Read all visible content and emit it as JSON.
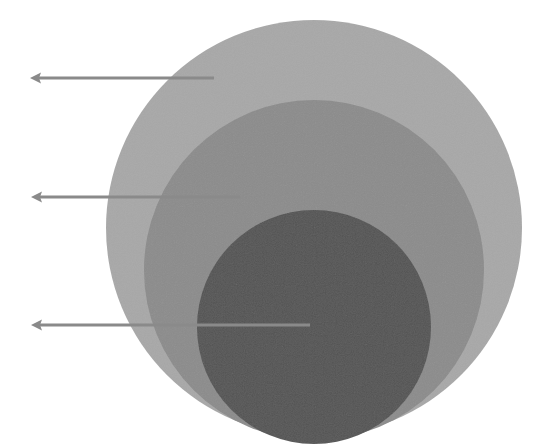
{
  "diagram": {
    "type": "nested-circles",
    "labels": [],
    "circles": [
      {
        "name": "outer",
        "cx": 314,
        "cy": 228,
        "r": 208,
        "color": "#a8a8a8"
      },
      {
        "name": "middle",
        "cx": 314,
        "cy": 270,
        "r": 170,
        "color": "#8c8c8c"
      },
      {
        "name": "inner",
        "cx": 314,
        "cy": 327,
        "r": 117,
        "color": "#545454"
      }
    ],
    "arrows": [
      {
        "name": "outer-arrow",
        "y": 78,
        "x_tail": 214,
        "x_tip": 30,
        "color": "#8a8a8a"
      },
      {
        "name": "middle-arrow",
        "y": 197,
        "x_tail": 240,
        "x_tip": 31,
        "color": "#8a8a8a"
      },
      {
        "name": "inner-arrow",
        "y": 325,
        "x_tail": 310,
        "x_tip": 31,
        "color": "#8a8a8a"
      }
    ]
  }
}
